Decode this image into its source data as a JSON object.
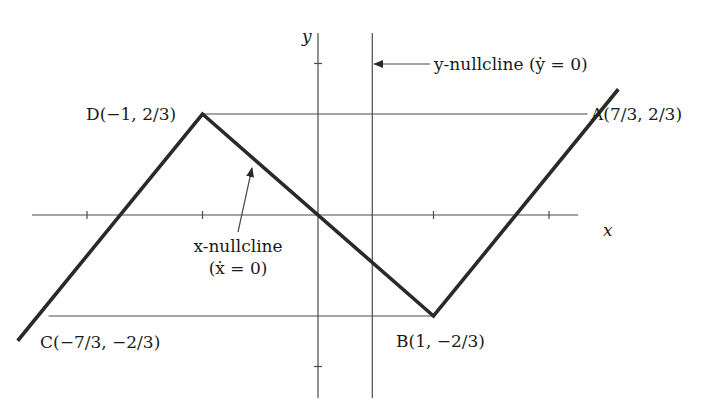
{
  "figure": {
    "axes": {
      "x_label": "x",
      "y_label": "y",
      "x_ticks": [
        -2,
        -1,
        1,
        2
      ],
      "y_ticks": [
        -1,
        1
      ]
    },
    "x_nullcline": {
      "label_line1": "x-nullcline",
      "label_line2": "(ẋ = 0)",
      "vertices": [
        {
          "x": -2.6,
          "y": -0.83
        },
        {
          "x": -1,
          "y": 0.6667
        },
        {
          "x": 1,
          "y": -0.6667
        },
        {
          "x": 2.6,
          "y": 0.83
        }
      ]
    },
    "y_nullcline": {
      "label": "y-nullcline (ẏ = 0)",
      "x_value": 0.47
    },
    "horizontal_guides": [
      {
        "y": 0.6667,
        "x_from": -1,
        "x_to": 2.3333
      },
      {
        "y": -0.6667,
        "x_from": -2.3333,
        "x_to": 1
      }
    ],
    "points": [
      {
        "id": "A",
        "label": "A(7/3, 2/3)",
        "x": 2.3333,
        "y": 0.6667
      },
      {
        "id": "B",
        "label": "B(1, −2/3)",
        "x": 1,
        "y": -0.6667
      },
      {
        "id": "C",
        "label": "C(−7/3, −2/3)",
        "x": -2.3333,
        "y": -0.6667
      },
      {
        "id": "D",
        "label": "D(−1, 2/3)",
        "x": -1,
        "y": 0.6667
      }
    ],
    "ranges": {
      "x": [
        -2.5,
        2.7
      ],
      "y": [
        -1.3,
        1.2
      ]
    }
  }
}
